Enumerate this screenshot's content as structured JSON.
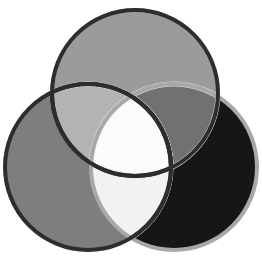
{
  "figure": {
    "name": "three-circle-venn-diagram",
    "background_color": "#ffffff",
    "width": 262,
    "height": 259
  },
  "chart_data": {
    "type": "venn",
    "set_count": 3,
    "sets": [
      {
        "id": "top",
        "label": "Top circle",
        "fill": "#9b9b9b",
        "stroke": "#2d2d2d",
        "stroke_width": 4,
        "cx": 135,
        "cy": 93,
        "r": 83
      },
      {
        "id": "left",
        "label": "Left circle",
        "fill": "#7e7e7e",
        "stroke": "#2d2d2d",
        "stroke_width": 4,
        "cx": 88,
        "cy": 167,
        "r": 83
      },
      {
        "id": "right",
        "label": "Right circle",
        "fill": "#161616",
        "stroke": "#a8a8a8",
        "stroke_width": 4,
        "cx": 174,
        "cy": 167,
        "r": 83
      }
    ],
    "regions": [
      {
        "id": "top-only",
        "label": "Top only",
        "fill": "#9b9b9b"
      },
      {
        "id": "left-only",
        "label": "Left only",
        "fill": "#7e7e7e"
      },
      {
        "id": "right-only",
        "label": "Right only",
        "fill": "#161616"
      },
      {
        "id": "top-left",
        "label": "Top and Left",
        "fill": "#b3b3b3"
      },
      {
        "id": "top-right",
        "label": "Top and Right",
        "fill": "#717171"
      },
      {
        "id": "left-right",
        "label": "Left and Right",
        "fill": "#f2f2f2"
      },
      {
        "id": "center",
        "label": "All three",
        "fill": "#fbfbfb"
      }
    ],
    "halo": {
      "label": "light separating ring",
      "color": "#dedede",
      "width": 5
    },
    "xlabel": "",
    "ylabel": "",
    "legend": "none",
    "grid": false
  }
}
